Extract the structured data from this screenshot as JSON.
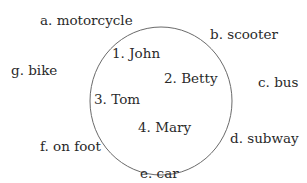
{
  "diagram": {
    "people": [
      {
        "label": "1. John"
      },
      {
        "label": "2. Betty"
      },
      {
        "label": "3. Tom"
      },
      {
        "label": "4. Mary"
      }
    ],
    "transport": [
      {
        "label": "a. motorcycle"
      },
      {
        "label": "b. scooter"
      },
      {
        "label": "c. bus"
      },
      {
        "label": "d. subway"
      },
      {
        "label": "e. car"
      },
      {
        "label": "f. on foot"
      },
      {
        "label": "g. bike"
      }
    ],
    "colors": {
      "circle": "#6a6a6a",
      "text": "#2a2a2a"
    }
  }
}
